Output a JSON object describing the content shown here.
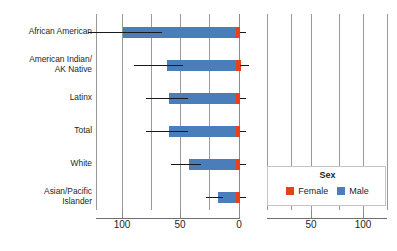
{
  "chart_data": {
    "type": "bar",
    "title": "",
    "subtitle": "",
    "xlabel": "",
    "ylabel": "",
    "orientation": "horizontal-diverging",
    "grid": true,
    "legend_position": "bottom-right",
    "legend_title": "Sex",
    "categories": [
      "African American",
      "American Indian/ AK Native",
      "Latinx",
      "Total",
      "White",
      "Asian/Pacific Islander"
    ],
    "series": [
      {
        "name": "Male",
        "color": "#4a7ebb",
        "values": [
          100,
          62,
          60,
          60,
          43,
          18
        ],
        "error_low": [
          130,
          90,
          80,
          80,
          58,
          28
        ],
        "error_high": [
          66,
          48,
          44,
          44,
          33,
          14
        ]
      },
      {
        "name": "Female",
        "color": "#e8401c",
        "values": [
          3,
          4,
          3,
          3,
          3,
          2
        ],
        "error_low": [
          1,
          1,
          1,
          1,
          1,
          1
        ],
        "error_high": [
          5,
          9,
          5,
          6,
          5,
          4
        ]
      }
    ],
    "axis_left": {
      "ticks": [
        100,
        50,
        0
      ],
      "direction": "decreasing-right"
    },
    "axis_right": {
      "ticks": [
        50,
        100
      ],
      "direction": "increasing-right"
    },
    "tick_labels_all": [
      "100",
      "50",
      "0",
      "50",
      "100"
    ],
    "axis_caption": "",
    "zero_value": 0,
    "units": "per 100,000"
  },
  "categories_display": [
    {
      "line1": "African American",
      "line2": ""
    },
    {
      "line1": "American Indian/",
      "line2": "AK Native"
    },
    {
      "line1": "Latinx",
      "line2": ""
    },
    {
      "line1": "Total",
      "line2": ""
    },
    {
      "line1": "White",
      "line2": ""
    },
    {
      "line1": "Asian/Pacific",
      "line2": "Islander"
    }
  ],
  "ticks": [
    {
      "label": "100",
      "x": 122
    },
    {
      "label": "50",
      "x": 180
    },
    {
      "label": "0",
      "x": 239
    },
    {
      "label": "50",
      "x": 311
    },
    {
      "label": "100",
      "x": 363
    }
  ],
  "legend": {
    "title": "Sex",
    "items": [
      {
        "label": "Female",
        "color": "#e8401c"
      },
      {
        "label": "Male",
        "color": "#4a7ebb"
      }
    ]
  }
}
